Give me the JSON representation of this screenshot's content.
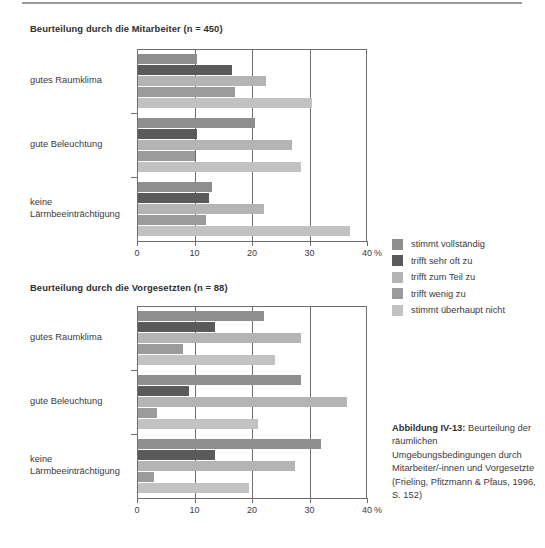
{
  "chart_data": [
    {
      "type": "bar",
      "title": "Beurteilung durch die Mitarbeiter (n = 450)",
      "orientation": "horizontal",
      "xlabel": "",
      "ylabel": "",
      "xunit": "%",
      "xlim": [
        0,
        40
      ],
      "xticks": [
        0,
        10,
        20,
        30,
        40
      ],
      "xticklabels": [
        "0",
        "10",
        "20",
        "30",
        "40"
      ],
      "grid": true,
      "legend_position": "right",
      "categories": [
        "gutes Raumklima",
        "gute Beleuchtung",
        "keine Lärmbeeinträchtigung"
      ],
      "series": [
        {
          "name": "stimmt vollständig",
          "color": "#8e8e8e",
          "values": [
            10.5,
            20.5,
            13.0
          ]
        },
        {
          "name": "trifft sehr oft zu",
          "color": "#5a5a5a",
          "values": [
            16.5,
            10.5,
            12.5
          ]
        },
        {
          "name": "trifft zum Teil zu",
          "color": "#b4b4b4",
          "values": [
            22.5,
            27.0,
            22.0
          ]
        },
        {
          "name": "trifft wenig zu",
          "color": "#9b9b9b",
          "values": [
            17.0,
            10.0,
            12.0
          ]
        },
        {
          "name": "stimmt überhaupt nicht",
          "color": "#c2c2c2",
          "values": [
            30.5,
            28.5,
            37.0
          ]
        }
      ]
    },
    {
      "type": "bar",
      "title": "Beurteilung durch die Vorgesetzten (n = 88)",
      "orientation": "horizontal",
      "xlabel": "",
      "ylabel": "",
      "xunit": "%",
      "xlim": [
        0,
        40
      ],
      "xticks": [
        0,
        10,
        20,
        30,
        40
      ],
      "xticklabels": [
        "0",
        "10",
        "20",
        "30",
        "40"
      ],
      "grid": true,
      "legend_position": "right",
      "categories": [
        "gutes Raumklima",
        "gute Beleuchtung",
        "keine Lärmbeeinträchtigung"
      ],
      "series": [
        {
          "name": "stimmt vollständig",
          "color": "#8e8e8e",
          "values": [
            22.0,
            28.5,
            32.0
          ]
        },
        {
          "name": "trifft sehr oft zu",
          "color": "#5a5a5a",
          "values": [
            13.5,
            9.0,
            13.5
          ]
        },
        {
          "name": "trifft zum Teil zu",
          "color": "#b4b4b4",
          "values": [
            28.5,
            36.5,
            27.5
          ]
        },
        {
          "name": "trifft wenig zu",
          "color": "#9b9b9b",
          "values": [
            8.0,
            3.5,
            3.0
          ]
        },
        {
          "name": "stimmt überhaupt nicht",
          "color": "#c2c2c2",
          "values": [
            24.0,
            21.0,
            19.5
          ]
        }
      ]
    }
  ],
  "charts": {
    "top": {
      "title": "Beurteilung durch die Mitarbeiter (n = 450)",
      "categories": [
        "gutes Raumklima",
        "gute Beleuchtung",
        "keine\nLärmbeeinträchtigung"
      ],
      "xticklabels": [
        "0",
        "10",
        "20",
        "30",
        "40"
      ],
      "unit": "%"
    },
    "bottom": {
      "title": "Beurteilung durch die Vorgesetzten (n = 88)",
      "categories": [
        "gutes Raumklima",
        "gute Beleuchtung",
        "keine\nLärmbeeinträchtigung"
      ],
      "xticklabels": [
        "0",
        "10",
        "20",
        "30",
        "40"
      ],
      "unit": "%"
    }
  },
  "legend": {
    "items": [
      {
        "label": "stimmt vollständig",
        "color": "#8e8e8e"
      },
      {
        "label": "trifft sehr oft zu",
        "color": "#5a5a5a"
      },
      {
        "label": "trifft zum Teil zu",
        "color": "#b4b4b4"
      },
      {
        "label": "trifft wenig zu",
        "color": "#9b9b9b"
      },
      {
        "label": "stimmt überhaupt nicht",
        "color": "#c2c2c2"
      }
    ]
  },
  "caption": {
    "label": "Abbildung IV-13:",
    "text": " Beurteilung der räumlichen Umgebungsbedingungen durch Mitarbeiter/-innen und Vorgesetzte (Frieling, Pfitzmann & Pfaus, 1996, S. 152)"
  }
}
